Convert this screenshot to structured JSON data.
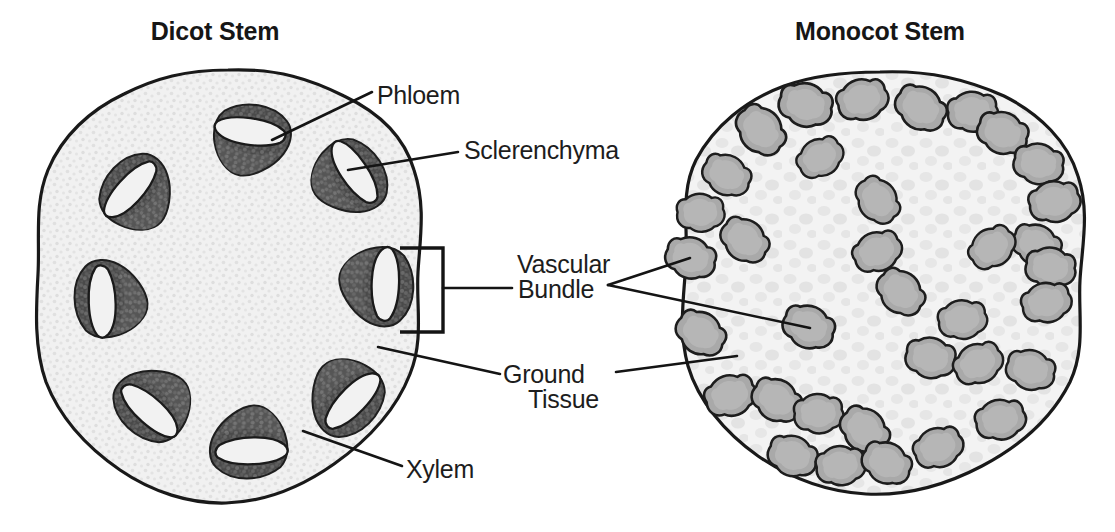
{
  "figure": {
    "caption_titles": {
      "dicot": "Dicot Stem",
      "monocot": "Monocot Stem"
    },
    "labels": {
      "phloem": "Phloem",
      "sclerenchyma": "Sclerenchyma",
      "vascular_bundle_line1": "Vascular",
      "vascular_bundle_line2": "Bundle",
      "ground_tissue_line1": "Ground",
      "ground_tissue_line2": "Tissue",
      "xylem": "Xylem"
    },
    "colors": {
      "ink": "#141414",
      "text": "#1a1a1a",
      "dicot_ground_fill": "#f0f0f0",
      "dicot_ground_stipple": "#dedede",
      "dicot_bundle_dark": "#4e4e4e",
      "dicot_bundle_light": "#f2f2f2",
      "monocot_ground_fill": "#f2f2f2",
      "monocot_ground_mottle": "#e4e4e4",
      "monocot_bundle_fill": "#a9a9a9",
      "outline": "#1b1b1b",
      "background": "#ffffff"
    },
    "dicot": {
      "outline_center": [
        228,
        288
      ],
      "bundle_count": 9,
      "bundles": [
        {
          "cx": 253,
          "cy": 140,
          "angle": 8
        },
        {
          "cx": 350,
          "cy": 180,
          "angle": 56
        },
        {
          "cx": 377,
          "cy": 288,
          "angle": 92
        },
        {
          "cx": 344,
          "cy": 398,
          "angle": 134
        },
        {
          "cx": 247,
          "cy": 443,
          "angle": 178
        },
        {
          "cx": 152,
          "cy": 402,
          "angle": 222
        },
        {
          "cx": 110,
          "cy": 297,
          "angle": 268
        },
        {
          "cx": 137,
          "cy": 193,
          "angle": 312
        },
        {
          "cx": 182,
          "cy": 148,
          "angle": 336
        }
      ]
    },
    "monocot": {
      "outline_center": [
        882,
        292
      ],
      "bundle_count": 33,
      "bundles": [
        {
          "cx": 805,
          "cy": 105
        },
        {
          "cx": 862,
          "cy": 100
        },
        {
          "cx": 920,
          "cy": 108
        },
        {
          "cx": 968,
          "cy": 112
        },
        {
          "cx": 762,
          "cy": 130
        },
        {
          "cx": 1000,
          "cy": 132
        },
        {
          "cx": 820,
          "cy": 158
        },
        {
          "cx": 1036,
          "cy": 163
        },
        {
          "cx": 726,
          "cy": 175
        },
        {
          "cx": 877,
          "cy": 200
        },
        {
          "cx": 1052,
          "cy": 200
        },
        {
          "cx": 700,
          "cy": 213
        },
        {
          "cx": 744,
          "cy": 240
        },
        {
          "cx": 1036,
          "cy": 243
        },
        {
          "cx": 877,
          "cy": 252
        },
        {
          "cx": 690,
          "cy": 258
        },
        {
          "cx": 992,
          "cy": 248
        },
        {
          "cx": 1049,
          "cy": 265
        },
        {
          "cx": 900,
          "cy": 290
        },
        {
          "cx": 1045,
          "cy": 300
        },
        {
          "cx": 808,
          "cy": 327
        },
        {
          "cx": 962,
          "cy": 320
        },
        {
          "cx": 700,
          "cy": 333
        },
        {
          "cx": 930,
          "cy": 358
        },
        {
          "cx": 975,
          "cy": 362
        },
        {
          "cx": 1030,
          "cy": 368
        },
        {
          "cx": 730,
          "cy": 395
        },
        {
          "cx": 775,
          "cy": 398
        },
        {
          "cx": 816,
          "cy": 412
        },
        {
          "cx": 862,
          "cy": 428
        },
        {
          "cx": 1000,
          "cy": 420
        },
        {
          "cx": 790,
          "cy": 455
        },
        {
          "cx": 838,
          "cy": 465
        },
        {
          "cx": 885,
          "cy": 462
        },
        {
          "cx": 938,
          "cy": 448
        }
      ]
    },
    "leaders": {
      "phloem": {
        "from": [
          372,
          92
        ],
        "to": [
          272,
          140
        ]
      },
      "sclerenchyma": {
        "from": [
          458,
          152
        ],
        "to": [
          348,
          170
        ]
      },
      "vascular_bundle_bracket": {
        "x": 400,
        "y_top": 248,
        "y_bottom": 332,
        "width": 44
      },
      "vascular_bundle_stem": {
        "from": [
          444,
          288
        ],
        "to": [
          512,
          288
        ]
      },
      "vascular_bundle_branch_a": {
        "from": [
          608,
          285
        ],
        "to": [
          690,
          258
        ]
      },
      "vascular_bundle_branch_b": {
        "from": [
          608,
          285
        ],
        "to": [
          810,
          328
        ]
      },
      "ground_tissue_left": {
        "from": [
          500,
          374
        ],
        "to": [
          378,
          347
        ]
      },
      "ground_tissue_right": {
        "from": [
          616,
          372
        ],
        "to": [
          737,
          356
        ]
      },
      "xylem": {
        "from": [
          402,
          466
        ],
        "to": [
          303,
          431
        ]
      }
    }
  }
}
